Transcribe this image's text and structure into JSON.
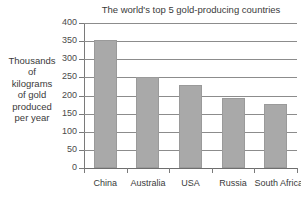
{
  "chart_data": {
    "type": "bar",
    "title": "The world's top 5 gold-producing countries",
    "categories": [
      "China",
      "Australia",
      "USA",
      "Russia",
      "South Africa"
    ],
    "values": [
      353,
      252,
      228,
      194,
      176
    ],
    "xlabel": "",
    "ylabel": "Thousands of kilograms of gold produced per year",
    "ylabel_lines": [
      "Thousands",
      "of",
      "kilograms",
      "of gold",
      "produced",
      "per year"
    ],
    "ylim": [
      0,
      400
    ],
    "ytick_labels": [
      "400",
      "350",
      "300",
      "250",
      "200",
      "150",
      "100",
      "50",
      "0"
    ],
    "ytick_values": [
      400,
      350,
      300,
      250,
      200,
      150,
      100,
      50,
      0
    ],
    "grid": true,
    "legend": false,
    "bar_color": "#a9a9a9",
    "grid_color": "#8c8c8c",
    "axis_color": "#7a7a7a",
    "text_color": "#3a3a3a",
    "background": "#ffffff"
  }
}
